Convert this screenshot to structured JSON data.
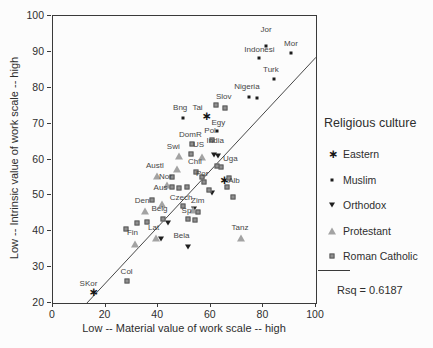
{
  "x_axis": {
    "title": "Low -- Material value of work scale -- high",
    "min": 0,
    "max": 100,
    "ticks": [
      0,
      20,
      40,
      60,
      80,
      100
    ]
  },
  "y_axis": {
    "title": "Low -- Intrinsic value of work scale -- high",
    "min": 20,
    "max": 100,
    "ticks": [
      20,
      30,
      40,
      50,
      60,
      70,
      80,
      90,
      100
    ]
  },
  "legend": {
    "title": "Religious culture",
    "items": [
      {
        "label": "Eastern",
        "marker": "eastern"
      },
      {
        "label": "Muslim",
        "marker": "muslim"
      },
      {
        "label": "Orthodox",
        "marker": "orthodox"
      },
      {
        "label": "Protestant",
        "marker": "protestant"
      },
      {
        "label": "Roman Catholic",
        "marker": "catholic"
      }
    ],
    "fit_line_swatch": true,
    "rsq": "Rsq = 0.6187"
  },
  "chart_data": {
    "type": "scatter",
    "title": "",
    "xlabel": "Low -- Material value of work scale -- high",
    "ylabel": "Low -- Intrinsic value of work scale -- high",
    "xlim": [
      0,
      100
    ],
    "ylim": [
      20,
      100
    ],
    "rsq": 0.6187,
    "fit_line": {
      "x1": 12.4,
      "y1": 19.6,
      "x2": 100,
      "y2": 88.5
    },
    "groups": [
      {
        "name": "Eastern",
        "marker": "eastern",
        "points": [
          {
            "x": 15,
            "y": 23,
            "l": "SKor",
            "dx": -4,
            "dy": -4
          },
          {
            "x": 58,
            "y": 72,
            "l": "Tai",
            "dx": -8,
            "dy": -4
          },
          {
            "x": 64.7,
            "y": 54.3,
            "l": "Alb",
            "anchor": "right",
            "dx": 5
          }
        ]
      },
      {
        "name": "Muslim",
        "marker": "muslim",
        "points": [
          {
            "x": 81,
            "y": 91.5,
            "l": "Jor",
            "dy": -12
          },
          {
            "x": 78.5,
            "y": 88.3,
            "l": "Indonesi",
            "dy": -4
          },
          {
            "x": 90.5,
            "y": 89.8,
            "l": "Mor",
            "dy": -5
          },
          {
            "x": 84,
            "y": 82.3,
            "l": "Turk",
            "dx": -3,
            "dy": -5
          },
          {
            "x": 74.5,
            "y": 77.5,
            "l": "Nigeria",
            "dx": -2,
            "dy": -6
          },
          {
            "x": 77.5,
            "y": 77.2
          },
          {
            "x": 49.5,
            "y": 71.5,
            "l": "Bng",
            "dx": -3,
            "dy": -6
          },
          {
            "x": 62.5,
            "y": 68,
            "l": "Egy",
            "dx": 1,
            "dy": -4
          }
        ]
      },
      {
        "name": "Orthodox",
        "marker": "orthodox",
        "points": [
          {
            "x": 61.3,
            "y": 61.3,
            "l": "India",
            "dx": 1,
            "dy": -10
          },
          {
            "x": 62.8,
            "y": 61
          },
          {
            "x": 53.5,
            "y": 46.3,
            "l": "Zim",
            "dx": 4,
            "dy": -4
          },
          {
            "x": 60.4,
            "y": 50.6
          },
          {
            "x": 43.8,
            "y": 42.4
          },
          {
            "x": 41,
            "y": 37.8
          },
          {
            "x": 51.5,
            "y": 35.7,
            "l": "Bela",
            "dx": -7,
            "dy": -7
          }
        ]
      },
      {
        "name": "Protestant",
        "marker": "protestant",
        "points": [
          {
            "x": 48,
            "y": 61,
            "l": "Swi",
            "dx": -6,
            "dy": -5
          },
          {
            "x": 56.5,
            "y": 60.6,
            "l": "US",
            "dx": -3,
            "dy": -8
          },
          {
            "x": 39.5,
            "y": 55.5,
            "l": "Austl",
            "dx": -2,
            "dy": -6
          },
          {
            "x": 43.5,
            "y": 53,
            "l": "Nor",
            "dx": -2,
            "dy": -4
          },
          {
            "x": 35,
            "y": 45.7,
            "l": "Den",
            "dx": -3,
            "dy": -6
          },
          {
            "x": 31,
            "y": 36.5,
            "l": "Fin",
            "dx": -2,
            "dy": -7
          },
          {
            "x": 39,
            "y": 38,
            "l": "Lat",
            "dx": -2,
            "dy": -6
          },
          {
            "x": 71.5,
            "y": 38,
            "l": "Tanz",
            "dx": -1,
            "dy": -6
          },
          {
            "x": 47.3,
            "y": 57.3
          },
          {
            "x": 53.1,
            "y": 45.8
          },
          {
            "x": 41.4,
            "y": 47.7
          }
        ]
      },
      {
        "name": "Roman Catholic",
        "marker": "catholic",
        "points": [
          {
            "x": 28,
            "y": 26,
            "l": "Col",
            "dy": -5
          },
          {
            "x": 53,
            "y": 64.3,
            "l": "DomR",
            "dx": -2,
            "dy": -5
          },
          {
            "x": 60.5,
            "y": 65.5,
            "l": "Pol",
            "dx": -2,
            "dy": -5
          },
          {
            "x": 54.3,
            "y": 56.6,
            "l": "Chil",
            "dx": -1,
            "dy": -6
          },
          {
            "x": 57.5,
            "y": 53.6,
            "l": "Por",
            "dx": -2,
            "dy": -4
          },
          {
            "x": 64,
            "y": 58,
            "l": "Uga",
            "dx": 9,
            "dy": -4
          },
          {
            "x": 62.3,
            "y": 58.3
          },
          {
            "x": 45.4,
            "y": 52.4,
            "l": "Aus",
            "anchor": "left",
            "dx": -5
          },
          {
            "x": 45.4,
            "y": 55.2
          },
          {
            "x": 48,
            "y": 52
          },
          {
            "x": 51.1,
            "y": 52.2
          },
          {
            "x": 42,
            "y": 43.3,
            "l": "Belg",
            "dx": -4,
            "dy": -6
          },
          {
            "x": 49.5,
            "y": 47,
            "l": "Czech",
            "dx": -2,
            "dy": -4
          },
          {
            "x": 51.5,
            "y": 43.4,
            "l": "Sp",
            "dx": -2,
            "dy": -4
          },
          {
            "x": 55,
            "y": 45.5
          },
          {
            "x": 54,
            "y": 43
          },
          {
            "x": 32.1,
            "y": 42.3
          },
          {
            "x": 35.9,
            "y": 42.7
          },
          {
            "x": 27.7,
            "y": 40.7
          },
          {
            "x": 37.8,
            "y": 48.6
          },
          {
            "x": 65.3,
            "y": 74.4,
            "l": "Slov",
            "dx": -1,
            "dy": -7
          },
          {
            "x": 62,
            "y": 75.2
          },
          {
            "x": 52.4,
            "y": 61.5
          },
          {
            "x": 56.6,
            "y": 55.2
          },
          {
            "x": 67,
            "y": 54.9
          },
          {
            "x": 66,
            "y": 52.2
          },
          {
            "x": 59.4,
            "y": 51.5
          },
          {
            "x": 68.5,
            "y": 49.6
          }
        ]
      }
    ]
  }
}
